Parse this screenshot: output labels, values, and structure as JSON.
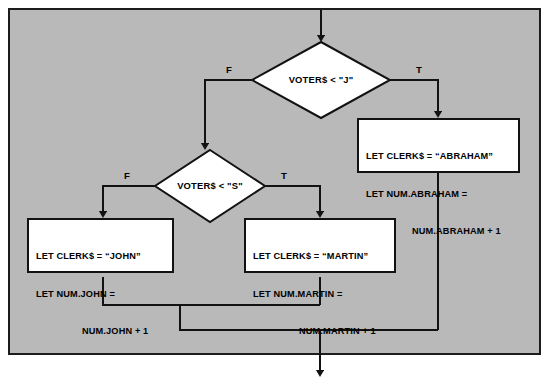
{
  "diagram": {
    "type": "flowchart",
    "background_color": "#b9b9b9",
    "frame_border_color": "#1c1c1c",
    "box_fill_color": "#ffffff",
    "line_color": "#121212",
    "entry": {
      "name": "entry-arrow",
      "from": "top-border",
      "to": "decision-voters-j"
    },
    "decisions": [
      {
        "id": "decision-voters-j",
        "label": "VOTER$ < \"J\"",
        "true_label": "T",
        "false_label": "F",
        "true_target": "process-abraham",
        "false_target": "decision-voters-s"
      },
      {
        "id": "decision-voters-s",
        "label": "VOTER$ < \"S\"",
        "true_label": "T",
        "false_label": "F",
        "true_target": "process-martin",
        "false_target": "process-john"
      }
    ],
    "processes": [
      {
        "id": "process-abraham",
        "lines": [
          "LET CLERK$ = “ABRAHAM”",
          "LET NUM.ABRAHAM =",
          "NUM.ABRAHAM + 1"
        ]
      },
      {
        "id": "process-john",
        "lines": [
          "LET CLERK$ = “JOHN”",
          "LET NUM.JOHN =",
          "NUM.JOHN + 1"
        ]
      },
      {
        "id": "process-martin",
        "lines": [
          "LET CLERK$ = “MARTIN”",
          "LET NUM.MARTIN =",
          "NUM.MARTIN + 1"
        ]
      }
    ],
    "exit": {
      "name": "exit-arrow",
      "to": "bottom-border"
    }
  }
}
